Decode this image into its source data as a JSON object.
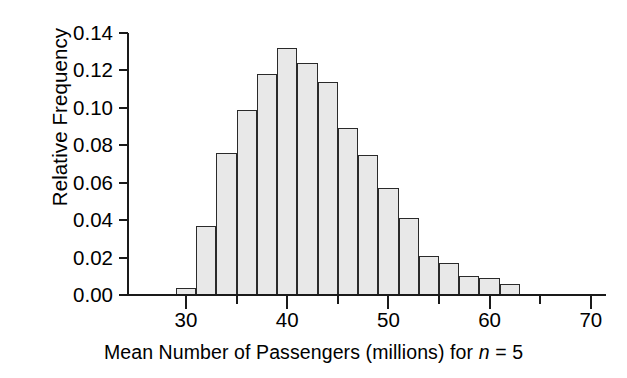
{
  "chart_data": {
    "type": "bar",
    "subtype": "histogram",
    "title": "",
    "xlabel": "Mean Number of Passengers (millions) for n = 5",
    "xlabel_parts": {
      "before": "Mean Number of Passengers (millions) for ",
      "italic": "n",
      "after": " = 5"
    },
    "ylabel": "Relative Frequency",
    "xlim": [
      27,
      74.3
    ],
    "ylim": [
      0.0,
      0.14
    ],
    "grid": false,
    "legend": null,
    "bin_width": 2,
    "x_major_ticks": [
      30,
      40,
      50,
      60,
      70
    ],
    "x_major_tick_labels": [
      "30",
      "40",
      "50",
      "60",
      "70"
    ],
    "x_minor_ticks": [
      35,
      45,
      55,
      65
    ],
    "y_ticks": [
      0.0,
      0.02,
      0.04,
      0.06,
      0.08,
      0.1,
      0.12,
      0.14
    ],
    "y_tick_labels": [
      "0.00",
      "0.02",
      "0.04",
      "0.06",
      "0.08",
      "0.10",
      "0.12",
      "0.14"
    ],
    "bins": [
      {
        "start": 29,
        "end": 31,
        "value": 0.004
      },
      {
        "start": 31,
        "end": 33,
        "value": 0.037
      },
      {
        "start": 33,
        "end": 35,
        "value": 0.076
      },
      {
        "start": 35,
        "end": 37,
        "value": 0.099
      },
      {
        "start": 37,
        "end": 39,
        "value": 0.118
      },
      {
        "start": 39,
        "end": 41,
        "value": 0.132
      },
      {
        "start": 41,
        "end": 43,
        "value": 0.124
      },
      {
        "start": 43,
        "end": 45,
        "value": 0.114
      },
      {
        "start": 45,
        "end": 47,
        "value": 0.089
      },
      {
        "start": 47,
        "end": 49,
        "value": 0.075
      },
      {
        "start": 49,
        "end": 51,
        "value": 0.057
      },
      {
        "start": 51,
        "end": 53,
        "value": 0.041
      },
      {
        "start": 53,
        "end": 55,
        "value": 0.021
      },
      {
        "start": 55,
        "end": 57,
        "value": 0.017
      },
      {
        "start": 57,
        "end": 59,
        "value": 0.01
      },
      {
        "start": 59,
        "end": 61,
        "value": 0.009
      },
      {
        "start": 61,
        "end": 63,
        "value": 0.006
      }
    ],
    "categories": [
      30,
      32,
      34,
      36,
      38,
      40,
      42,
      44,
      46,
      48,
      50,
      52,
      54,
      56,
      58,
      60,
      62
    ],
    "values": [
      0.004,
      0.037,
      0.076,
      0.099,
      0.118,
      0.132,
      0.124,
      0.114,
      0.089,
      0.075,
      0.057,
      0.041,
      0.021,
      0.017,
      0.01,
      0.009,
      0.006
    ],
    "colors": {
      "bar_fill": "#e8e8e8",
      "bar_stroke": "#2a2a2a",
      "axis": "#1a1a1a",
      "text": "#000000",
      "background": "#ffffff"
    }
  }
}
